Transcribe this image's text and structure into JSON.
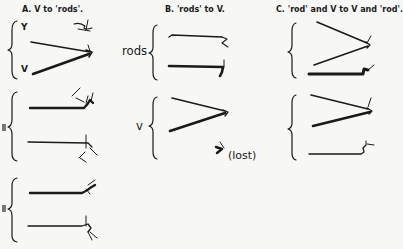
{
  "figure": {
    "columns": [
      {
        "id": "A",
        "heading": "A.  V to 'rods'."
      },
      {
        "id": "B",
        "heading": "B.  'rods' to V."
      },
      {
        "id": "C",
        "heading": "C.  'rod' and V to V and 'rod'."
      }
    ],
    "labels": {
      "y_label": "Y",
      "v_label": "V",
      "rods_label": "rods",
      "v_label_lower": "v",
      "lost_label": "(lost)"
    },
    "colors": {
      "ink": "#1a1a1a",
      "paper": "#f7f7f5"
    }
  }
}
